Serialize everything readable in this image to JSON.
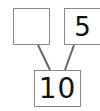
{
  "diagram": {
    "type": "number-bond",
    "parts": [
      {
        "id": "left",
        "value": ""
      },
      {
        "id": "right",
        "value": "5"
      }
    ],
    "whole": {
      "value": "10"
    },
    "colors": {
      "border": "#8a8a8a",
      "line": "#666666",
      "text": "#111111"
    }
  }
}
